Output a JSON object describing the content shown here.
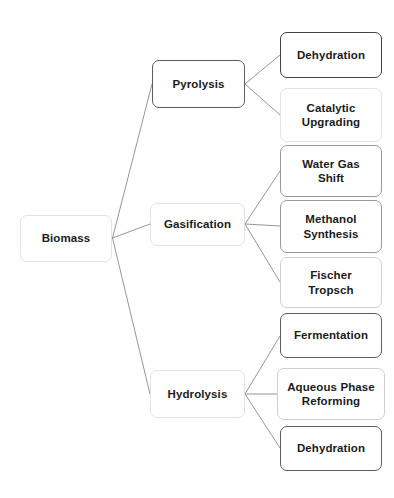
{
  "diagram": {
    "background_color": "#ffffff",
    "text_color": "#1b1b1b",
    "edge_color": "#8a8a8a",
    "root": {
      "label": "Biomass"
    },
    "branches": [
      {
        "label": "Pyrolysis",
        "children": [
          {
            "label": "Dehydration"
          },
          {
            "label": "Catalytic\nUpgrading"
          }
        ]
      },
      {
        "label": "Gasification",
        "children": [
          {
            "label": "Water Gas\nShift"
          },
          {
            "label": "Methanol\nSynthesis"
          },
          {
            "label": "Fischer\nTropsch"
          }
        ]
      },
      {
        "label": "Hydrolysis",
        "children": [
          {
            "label": "Fermentation"
          },
          {
            "label": "Aqueous Phase\nReforming"
          },
          {
            "label": "Dehydration"
          }
        ]
      }
    ]
  }
}
